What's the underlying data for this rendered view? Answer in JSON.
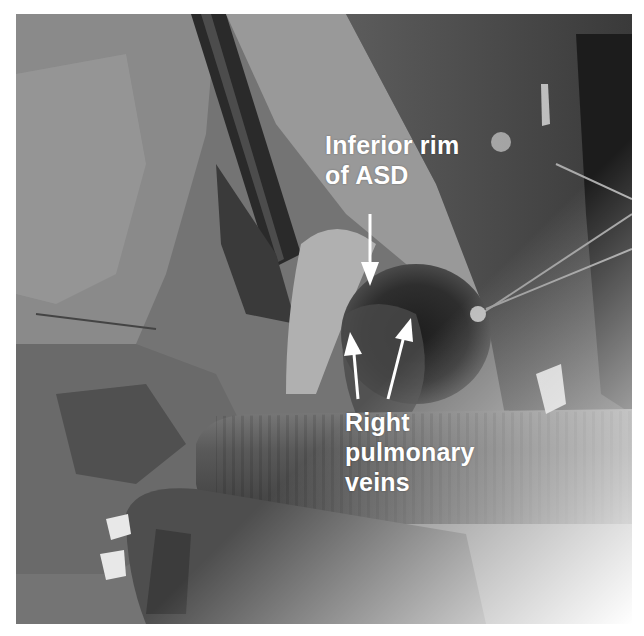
{
  "image": {
    "description": "Grayscale intraoperative photograph of heart showing atrial septal defect with annotated labels",
    "style": "grayscale surgical photograph"
  },
  "annotations": [
    {
      "id": "inferior-rim",
      "lines": [
        "Inferior rim",
        "of ASD"
      ],
      "arrow_count": 1,
      "arrow_direction": "down"
    },
    {
      "id": "right-pulmonary-veins",
      "lines": [
        "Right",
        "pulmonary",
        "veins"
      ],
      "arrow_count": 2,
      "arrow_direction": "up"
    }
  ],
  "colors": {
    "label_text": "#ffffff",
    "arrow": "#ffffff",
    "background": "#ffffff"
  }
}
